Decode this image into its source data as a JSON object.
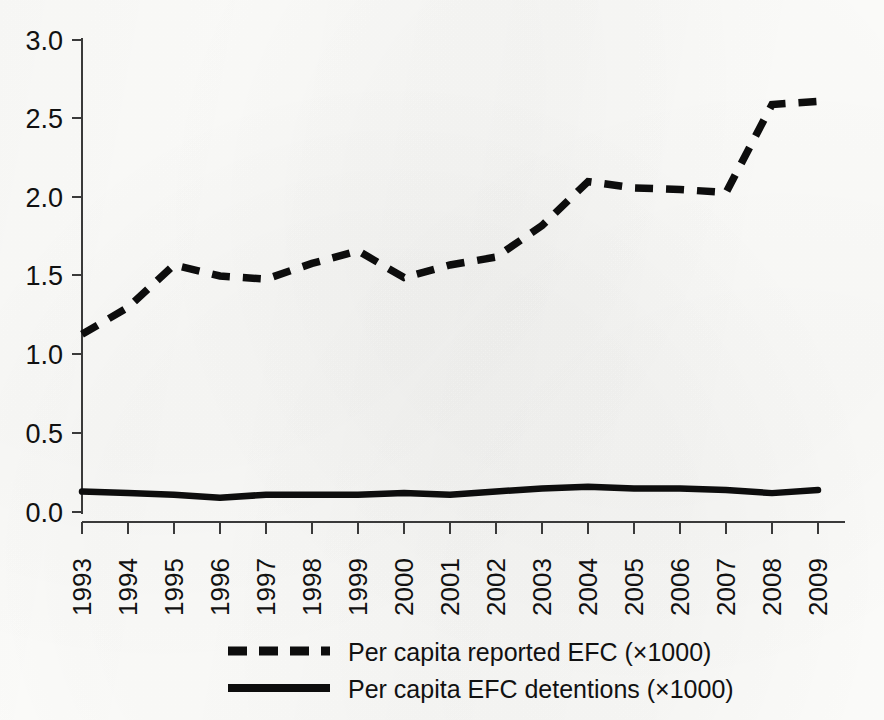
{
  "chart_data": {
    "type": "line",
    "title": "",
    "xlabel": "",
    "ylabel": "",
    "ylim": [
      0.0,
      3.0
    ],
    "yticks": [
      "0.0",
      "0.5",
      "1.0",
      "1.5",
      "2.0",
      "2.5",
      "3.0"
    ],
    "ytick_values": [
      0.0,
      0.5,
      1.0,
      1.5,
      2.0,
      2.5,
      3.0
    ],
    "grid": false,
    "legend_position": "bottom",
    "categories": [
      "1993",
      "1994",
      "1995",
      "1996",
      "1997",
      "1998",
      "1999",
      "2000",
      "2001",
      "2002",
      "2003",
      "2004",
      "2005",
      "2006",
      "2007",
      "2008",
      "2009"
    ],
    "series": [
      {
        "name": "Per capita reported EFC (×1000)",
        "style": "dashed",
        "color": "#0d0d0d",
        "values": [
          1.13,
          1.3,
          1.57,
          1.5,
          1.48,
          1.58,
          1.66,
          1.49,
          1.57,
          1.62,
          1.82,
          2.1,
          2.06,
          2.05,
          2.03,
          2.59,
          2.61
        ]
      },
      {
        "name": "Per capita EFC detentions (×1000)",
        "style": "solid",
        "color": "#0d0d0d",
        "values": [
          0.13,
          0.12,
          0.11,
          0.09,
          0.11,
          0.11,
          0.11,
          0.12,
          0.11,
          0.13,
          0.15,
          0.16,
          0.15,
          0.15,
          0.14,
          0.12,
          0.14
        ]
      }
    ]
  },
  "legend": {
    "entries": [
      {
        "label": "Per capita reported EFC (×1000)",
        "style": "dashed"
      },
      {
        "label": "Per capita EFC detentions (×1000)",
        "style": "solid"
      }
    ]
  },
  "axes": {
    "y_tick_labels": [
      "3.0",
      "2.5",
      "2.0",
      "1.5",
      "1.0",
      "0.5",
      "0.0"
    ],
    "x_tick_labels": [
      "1993",
      "1994",
      "1995",
      "1996",
      "1997",
      "1998",
      "1999",
      "2000",
      "2001",
      "2002",
      "2003",
      "2004",
      "2005",
      "2006",
      "2007",
      "2008",
      "2009"
    ]
  }
}
